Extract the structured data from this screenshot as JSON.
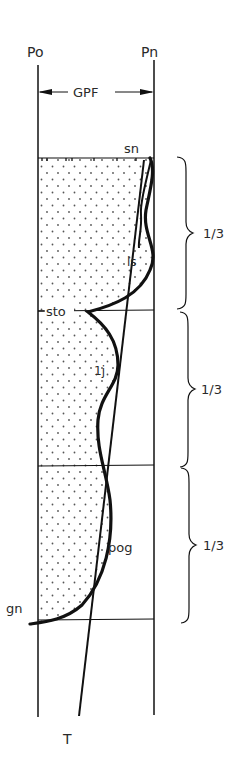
{
  "diagram": {
    "labels": {
      "po": "Po",
      "pn": "Pn",
      "gpf": "GPF",
      "sn": "sn",
      "ls": "ls",
      "sto": "sto",
      "lj": "1j",
      "pog": "pog",
      "gn": "gn",
      "t": "T"
    },
    "thirds": [
      "1/3",
      "1/3",
      "1/3"
    ],
    "colors": {
      "ink": "#111111",
      "text": "#2a2a2a",
      "stipple": "#555555",
      "background": "#ffffff"
    }
  }
}
